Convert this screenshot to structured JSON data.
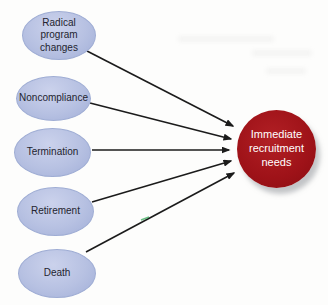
{
  "diagram": {
    "type": "cause-effect-convergence",
    "sources": [
      {
        "id": "radical-program-changes",
        "label": "Radical program changes"
      },
      {
        "id": "noncompliance",
        "label": "Noncompliance"
      },
      {
        "id": "termination",
        "label": "Termination"
      },
      {
        "id": "retirement",
        "label": "Retirement"
      },
      {
        "id": "death",
        "label": "Death"
      }
    ],
    "target": {
      "id": "immediate-recruitment-needs",
      "label": "Immediate recruitment needs"
    },
    "edges": [
      {
        "from": "radical-program-changes",
        "to": "immediate-recruitment-needs"
      },
      {
        "from": "noncompliance",
        "to": "immediate-recruitment-needs"
      },
      {
        "from": "termination",
        "to": "immediate-recruitment-needs"
      },
      {
        "from": "retirement",
        "to": "immediate-recruitment-needs"
      },
      {
        "from": "death",
        "to": "immediate-recruitment-needs"
      }
    ],
    "colors": {
      "source_fill": "#b7c1e2",
      "source_fill_highlight": "#cbd2ec",
      "source_edge": "#9fadd4",
      "source_text": "#23242f",
      "target_fill": "#9e1218",
      "target_text": "#ffffff",
      "arrow": "#1b1b1b",
      "shadow": "#91969b",
      "background": "#fdfdfc"
    }
  }
}
